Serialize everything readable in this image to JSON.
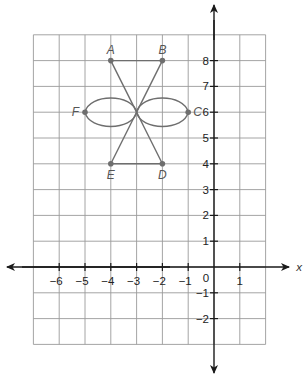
{
  "diagram": {
    "type": "coordinate-plane-figure",
    "axes": {
      "x_label": "x",
      "origin_label": "0",
      "x_ticks": [
        -6,
        -5,
        -4,
        -3,
        -2,
        -1,
        1
      ],
      "y_ticks": [
        8,
        7,
        6,
        5,
        4,
        3,
        2,
        1,
        -1,
        -2
      ],
      "grid_x_range": [
        -7,
        2
      ],
      "grid_y_range": [
        -3,
        9
      ]
    },
    "points": [
      {
        "label": "A",
        "x": -4,
        "y": 8
      },
      {
        "label": "B",
        "x": -2,
        "y": 8
      },
      {
        "label": "C",
        "x": -1,
        "y": 6
      },
      {
        "label": "D",
        "x": -2,
        "y": 4
      },
      {
        "label": "E",
        "x": -4,
        "y": 4
      },
      {
        "label": "F",
        "x": -5,
        "y": 6
      }
    ],
    "center": {
      "x": -3,
      "y": 6
    },
    "segments": [
      [
        "A",
        "B"
      ],
      [
        "E",
        "D"
      ],
      [
        "A",
        "D"
      ],
      [
        "B",
        "E"
      ]
    ],
    "petals": [
      {
        "from": "F",
        "to": "center"
      },
      {
        "from": "center",
        "to": "C"
      }
    ],
    "colors": {
      "figure": "#6e6e6e",
      "axis": "#1a1a1a",
      "grid": "#9a9a9a"
    }
  }
}
